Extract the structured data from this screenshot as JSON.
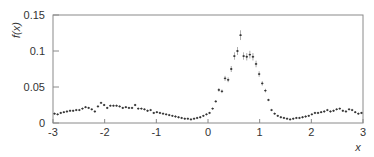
{
  "chart_data": {
    "type": "scatter",
    "title": "",
    "xlabel": "x",
    "ylabel": "f(x)",
    "xlim": [
      -3,
      3
    ],
    "ylim": [
      0,
      0.15
    ],
    "grid": false,
    "legend": null,
    "x_ticks": [
      -3,
      -2,
      -1,
      0,
      1,
      2,
      3
    ],
    "x_tick_labels": [
      "-3",
      "-2",
      "-1",
      "0",
      "1",
      "2",
      "3"
    ],
    "y_ticks": [
      0,
      0.05,
      0.1,
      0.15
    ],
    "y_tick_labels": [
      "0",
      "0.05",
      "0.1",
      "0.15"
    ],
    "series": [
      {
        "name": "data",
        "marker": "point-with-errorbars",
        "color": "#333333",
        "x": [
          -2.97,
          -2.91,
          -2.85,
          -2.79,
          -2.73,
          -2.67,
          -2.61,
          -2.55,
          -2.49,
          -2.43,
          -2.37,
          -2.31,
          -2.25,
          -2.19,
          -2.13,
          -2.07,
          -2.01,
          -1.95,
          -1.89,
          -1.83,
          -1.77,
          -1.71,
          -1.65,
          -1.59,
          -1.53,
          -1.47,
          -1.41,
          -1.35,
          -1.29,
          -1.23,
          -1.17,
          -1.11,
          -1.05,
          -0.99,
          -0.93,
          -0.87,
          -0.81,
          -0.75,
          -0.69,
          -0.63,
          -0.57,
          -0.51,
          -0.45,
          -0.39,
          -0.33,
          -0.27,
          -0.21,
          -0.15,
          -0.09,
          -0.03,
          0.03,
          0.09,
          0.15,
          0.21,
          0.27,
          0.33,
          0.39,
          0.45,
          0.51,
          0.57,
          0.63,
          0.69,
          0.75,
          0.81,
          0.87,
          0.93,
          0.99,
          1.05,
          1.11,
          1.17,
          1.23,
          1.29,
          1.35,
          1.41,
          1.47,
          1.53,
          1.59,
          1.65,
          1.71,
          1.77,
          1.83,
          1.89,
          1.95,
          2.01,
          2.07,
          2.13,
          2.19,
          2.25,
          2.31,
          2.37,
          2.43,
          2.49,
          2.55,
          2.61,
          2.67,
          2.73,
          2.79,
          2.85,
          2.91,
          2.97
        ],
        "y": [
          0.013,
          0.012,
          0.014,
          0.015,
          0.016,
          0.017,
          0.017,
          0.018,
          0.018,
          0.02,
          0.022,
          0.021,
          0.019,
          0.016,
          0.023,
          0.028,
          0.025,
          0.021,
          0.024,
          0.024,
          0.024,
          0.023,
          0.021,
          0.022,
          0.021,
          0.021,
          0.025,
          0.02,
          0.02,
          0.019,
          0.017,
          0.018,
          0.014,
          0.015,
          0.014,
          0.013,
          0.012,
          0.011,
          0.01,
          0.009,
          0.008,
          0.007,
          0.006,
          0.006,
          0.005,
          0.006,
          0.007,
          0.008,
          0.01,
          0.012,
          0.014,
          0.02,
          0.03,
          0.046,
          0.044,
          0.062,
          0.06,
          0.075,
          0.093,
          0.1,
          0.122,
          0.093,
          0.092,
          0.095,
          0.092,
          0.082,
          0.068,
          0.055,
          0.045,
          0.032,
          0.018,
          0.013,
          0.01,
          0.008,
          0.007,
          0.006,
          0.005,
          0.006,
          0.007,
          0.007,
          0.008,
          0.009,
          0.01,
          0.012,
          0.014,
          0.014,
          0.015,
          0.016,
          0.018,
          0.016,
          0.017,
          0.019,
          0.02,
          0.017,
          0.016,
          0.019,
          0.018,
          0.015,
          0.013,
          0.014
        ]
      }
    ]
  },
  "axes": {
    "xlabel": "x",
    "ylabel": "f(x)",
    "x_tick_labels": [
      "-3",
      "-2",
      "-1",
      "0",
      "1",
      "2",
      "3"
    ],
    "y_tick_labels": [
      "0",
      "0.05",
      "0.1",
      "0.15"
    ]
  }
}
